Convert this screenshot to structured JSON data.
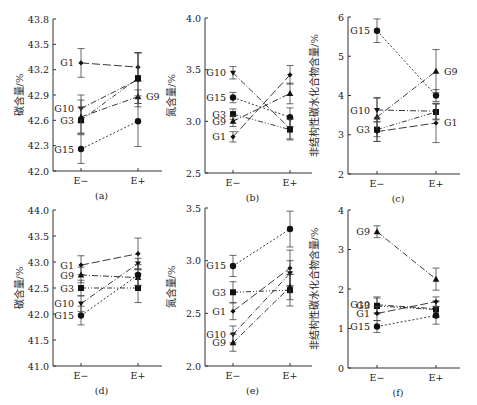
{
  "chart_data": [
    {
      "id": "a",
      "type": "line",
      "panel_label": "(a)",
      "ylabel": "碳含量/%",
      "ylim": [
        42.0,
        43.8
      ],
      "yticks": [
        42.0,
        42.3,
        42.6,
        42.9,
        43.2,
        43.5,
        43.8
      ],
      "ytick_labels": [
        "42.0",
        "42.3",
        "42.6",
        "42.9",
        "43.2",
        "43.5",
        "43.8"
      ],
      "categories": [
        "E−",
        "E+"
      ],
      "series": [
        {
          "name": "G1",
          "values": [
            43.28,
            43.23
          ],
          "err": [
            0.17,
            0.17
          ],
          "marker": "diamond",
          "dash": "8,3",
          "label_side": "left"
        },
        {
          "name": "G10",
          "values": [
            42.74,
            43.08
          ],
          "err": [
            0.16,
            0.32
          ],
          "marker": "star",
          "dash": "6,2,1,2",
          "label_side": "left"
        },
        {
          "name": "G3",
          "values": [
            42.6,
            43.1
          ],
          "err": [
            0.15,
            0.3
          ],
          "marker": "square",
          "dash": "5,2,1,2,1,2",
          "label_side": "left"
        },
        {
          "name": "G9",
          "values": [
            42.64,
            42.88
          ],
          "err": [
            0.2,
            0.08
          ],
          "marker": "triangle",
          "dash": "6,2,1,2",
          "label_side": "right"
        },
        {
          "name": "G15",
          "values": [
            42.26,
            42.59
          ],
          "err": [
            0.17,
            0.3
          ],
          "marker": "circle",
          "dash": "2,2",
          "label_side": "left"
        }
      ]
    },
    {
      "id": "b",
      "type": "line",
      "panel_label": "(b)",
      "ylabel": "氮含量/%",
      "ylim": [
        2.5,
        4.0
      ],
      "yticks": [
        2.5,
        3.0,
        3.5,
        4.0
      ],
      "ytick_labels": [
        "2.5",
        "3.0",
        "3.5",
        "4.0"
      ],
      "categories": [
        "E−",
        "E+"
      ],
      "series": [
        {
          "name": "G10",
          "values": [
            3.47,
            2.93
          ],
          "err": [
            0.06,
            0.1
          ],
          "marker": "star",
          "dash": "6,2,1,2",
          "label_side": "left"
        },
        {
          "name": "G15",
          "values": [
            3.23,
            3.04
          ],
          "err": [
            0.05,
            0.09
          ],
          "marker": "circle",
          "dash": "2,2",
          "label_side": "left"
        },
        {
          "name": "G3",
          "values": [
            3.07,
            2.92
          ],
          "err": [
            0.05,
            0.1
          ],
          "marker": "square",
          "dash": "5,2,1,2,1,2",
          "label_side": "left"
        },
        {
          "name": "G9",
          "values": [
            3.0,
            3.27
          ],
          "err": [
            0.05,
            0.1
          ],
          "marker": "triangle",
          "dash": "6,2,1,2",
          "label_side": "left"
        },
        {
          "name": "G1",
          "values": [
            2.85,
            3.45
          ],
          "err": [
            0.05,
            0.09
          ],
          "marker": "diamond",
          "dash": "8,3",
          "label_side": "left"
        }
      ]
    },
    {
      "id": "c",
      "type": "line",
      "panel_label": "(c)",
      "ylabel": "非结构性碳水化合物含量/%",
      "ylim": [
        2,
        6
      ],
      "yticks": [
        2,
        3,
        4,
        5,
        6
      ],
      "ytick_labels": [
        "2",
        "3",
        "4",
        "5",
        "6"
      ],
      "categories": [
        "E−",
        "E+"
      ],
      "series": [
        {
          "name": "G15",
          "values": [
            5.65,
            4.0
          ],
          "err": [
            0.3,
            0.15
          ],
          "marker": "circle",
          "dash": "2,2",
          "label_side": "left"
        },
        {
          "name": "G9",
          "values": [
            3.45,
            4.62
          ],
          "err": [
            0.5,
            0.55
          ],
          "marker": "triangle",
          "dash": "6,2,1,2",
          "label_side": "right"
        },
        {
          "name": "G10",
          "values": [
            3.63,
            3.6
          ],
          "err": [
            0.3,
            0.2
          ],
          "marker": "star",
          "dash": "6,2,1,2",
          "label_side": "left"
        },
        {
          "name": "G3",
          "values": [
            3.13,
            3.58
          ],
          "err": [
            0.3,
            0.2
          ],
          "marker": "square",
          "dash": "5,2,1,2,1,2",
          "label_side": "left"
        },
        {
          "name": "G1",
          "values": [
            3.08,
            3.3
          ],
          "err": [
            0.25,
            0.5
          ],
          "marker": "diamond",
          "dash": "8,3",
          "label_side": "right"
        }
      ]
    },
    {
      "id": "d",
      "type": "line",
      "panel_label": "(d)",
      "ylabel": "碳含量/%",
      "ylim": [
        41.0,
        44.0
      ],
      "yticks": [
        41.0,
        41.5,
        42.0,
        42.5,
        43.0,
        43.5,
        44.0
      ],
      "ytick_labels": [
        "41.0",
        "41.5",
        "42.0",
        "42.5",
        "43.0",
        "43.5",
        "44.0"
      ],
      "categories": [
        "E−",
        "E+"
      ],
      "series": [
        {
          "name": "G1",
          "values": [
            42.94,
            43.16
          ],
          "err": [
            0.18,
            0.3
          ],
          "marker": "diamond",
          "dash": "8,3",
          "label_side": "left"
        },
        {
          "name": "G9",
          "values": [
            42.75,
            42.7
          ],
          "err": [
            0.15,
            0.15
          ],
          "marker": "triangle",
          "dash": "6,2,1,2",
          "label_side": "left"
        },
        {
          "name": "G3",
          "values": [
            42.5,
            42.5
          ],
          "err": [
            0.15,
            0.28
          ],
          "marker": "square",
          "dash": "5,2,1,2,1,2",
          "label_side": "left"
        },
        {
          "name": "G10",
          "values": [
            42.2,
            42.97
          ],
          "err": [
            0.15,
            0.1
          ],
          "marker": "star",
          "dash": "6,2,1,2",
          "label_side": "left"
        },
        {
          "name": "G15",
          "values": [
            41.97,
            42.75
          ],
          "err": [
            0.18,
            0.2
          ],
          "marker": "circle",
          "dash": "2,2",
          "label_side": "left"
        }
      ]
    },
    {
      "id": "e",
      "type": "line",
      "panel_label": "(e)",
      "ylabel": "氮含量/%",
      "ylim": [
        2.0,
        3.5
      ],
      "yticks": [
        2.0,
        2.5,
        3.0,
        3.5
      ],
      "ytick_labels": [
        "2.0",
        "2.5",
        "3.0",
        "3.5"
      ],
      "categories": [
        "E−",
        "E+"
      ],
      "series": [
        {
          "name": "G15",
          "values": [
            2.95,
            3.3
          ],
          "err": [
            0.1,
            0.17
          ],
          "marker": "circle",
          "dash": "2,2",
          "label_side": "left"
        },
        {
          "name": "G3",
          "values": [
            2.7,
            2.72
          ],
          "err": [
            0.1,
            0.15
          ],
          "marker": "square",
          "dash": "5,2,1,2,1,2",
          "label_side": "left"
        },
        {
          "name": "G1",
          "values": [
            2.52,
            2.93
          ],
          "err": [
            0.08,
            0.17
          ],
          "marker": "diamond",
          "dash": "8,3",
          "label_side": "left"
        },
        {
          "name": "G10",
          "values": [
            2.3,
            2.88
          ],
          "err": [
            0.08,
            0.12
          ],
          "marker": "star",
          "dash": "6,2,1,2",
          "label_side": "left"
        },
        {
          "name": "G9",
          "values": [
            2.22,
            2.75
          ],
          "err": [
            0.08,
            0.12
          ],
          "marker": "triangle",
          "dash": "6,2,1,2",
          "label_side": "left"
        }
      ]
    },
    {
      "id": "f",
      "type": "line",
      "panel_label": "(f)",
      "ylabel": "非结构性碳水化合物含量/%",
      "ylim": [
        0,
        4
      ],
      "yticks": [
        0,
        1,
        2,
        3,
        4
      ],
      "ytick_labels": [
        "0",
        "1",
        "2",
        "3",
        "4"
      ],
      "categories": [
        "E−",
        "E+"
      ],
      "series": [
        {
          "name": "G9",
          "values": [
            3.45,
            2.25
          ],
          "err": [
            0.15,
            0.28
          ],
          "marker": "triangle",
          "dash": "6,2,1,2",
          "label_side": "left"
        },
        {
          "name": "G10",
          "values": [
            1.6,
            1.5
          ],
          "err": [
            0.2,
            0.2
          ],
          "marker": "star",
          "dash": "6,2,1,2",
          "label_side": "left"
        },
        {
          "name": "G3",
          "values": [
            1.57,
            1.48
          ],
          "err": [
            0.2,
            0.2
          ],
          "marker": "square",
          "dash": "5,2,1,2,1,2",
          "label_side": "left"
        },
        {
          "name": "G1",
          "values": [
            1.38,
            1.68
          ],
          "err": [
            0.18,
            0.12
          ],
          "marker": "diamond",
          "dash": "8,3",
          "label_side": "left"
        },
        {
          "name": "G15",
          "values": [
            1.05,
            1.33
          ],
          "err": [
            0.15,
            0.22
          ],
          "marker": "circle",
          "dash": "2,2",
          "label_side": "left"
        }
      ]
    }
  ]
}
